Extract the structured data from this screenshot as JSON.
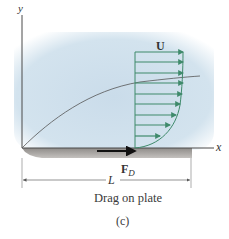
{
  "figure": {
    "caption": "Drag on plate",
    "sublabel": "(c)",
    "axis_x_label": "x",
    "axis_y_label": "y",
    "free_stream_label": "U",
    "drag_force_label": "F",
    "drag_force_subscript": "D",
    "length_label": "L",
    "colors": {
      "fluid": "#cfe0ec",
      "fluid_edge": "#e6eff6",
      "plate": "#a9a6a3",
      "plate_light": "#c9c6c3",
      "velocity_arrows": "#3f8a6b",
      "axes": "#4a4a4a",
      "boundary_layer": "#555555",
      "force_arrow": "#111111"
    },
    "velocity_profile": {
      "arrow_count": 10
    }
  }
}
